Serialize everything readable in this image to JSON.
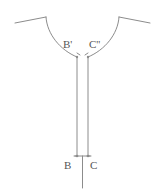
{
  "figure": {
    "kind": "line-diagram",
    "background_color": "#ffffff",
    "stroke_color": "#8c8c8c",
    "label_color": "#555555",
    "stroke_width": 1,
    "canvas": {
      "width": 165,
      "height": 195
    },
    "labels": {
      "upper_left": "B'",
      "upper_right": "C''",
      "lower_left": "B",
      "lower_right": "C"
    },
    "strokes": {
      "left_wing": "M 15 23 L 46 17",
      "left_arc": "M 46 17 C 47 34, 60 50, 77 57",
      "right_wing": "M 150 23 L 119 17",
      "right_arc": "M 119 17 C 118 34, 105 50, 88 57",
      "left_channel_wall": "M 77 57 L 77 156",
      "right_channel_wall": "M 88 57 L 88 156",
      "base_crossbar": "M 75 156 L 90 156",
      "center_stem": "M 82.5 156 L 82.5 188",
      "tick_upper_left": "M 77 53 L 80 55",
      "tick_upper_right": "M 88 53 L 85 55",
      "tick_lower_left": "M 74 156 L 78 156",
      "tick_lower_right": "M 87 156 L 91 156"
    },
    "markers": {
      "upper_left_dot": {
        "x": 77,
        "y": 57
      },
      "upper_right_dot": {
        "x": 88,
        "y": 57
      },
      "lower_left_dot": {
        "x": 77,
        "y": 156
      },
      "lower_right_dot": {
        "x": 88,
        "y": 156
      }
    }
  }
}
